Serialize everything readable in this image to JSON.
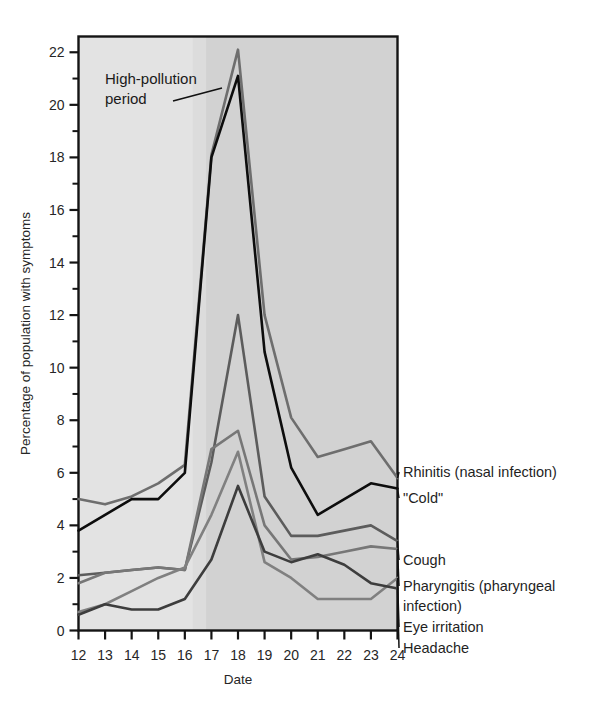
{
  "chart_data": {
    "type": "line",
    "title": "",
    "xlabel": "Date",
    "ylabel": "Percentage of population with symptoms",
    "x": [
      12,
      13,
      14,
      15,
      16,
      17,
      18,
      19,
      20,
      21,
      22,
      23,
      24
    ],
    "xlim": [
      12,
      24
    ],
    "ylim": [
      0,
      22.6
    ],
    "ytick_major": [
      0,
      2,
      4,
      6,
      8,
      10,
      12,
      14,
      16,
      18,
      20,
      22
    ],
    "ytick_minor": [
      1,
      3,
      5,
      7,
      9,
      11,
      13,
      15,
      17,
      19,
      21
    ],
    "grid": false,
    "legend_position": "right-inline-labels",
    "series": [
      {
        "name": "Rhinitis (nasal infection)",
        "label": "Rhinitis (nasal infection)",
        "color": "#6e6e6e",
        "width": 2.6,
        "values": [
          5.0,
          4.8,
          5.1,
          5.6,
          6.3,
          18.1,
          22.1,
          12.0,
          8.1,
          6.6,
          6.9,
          7.2,
          5.8
        ]
      },
      {
        "name": "\"Cold\"",
        "label": "\"Cold\"",
        "color": "#0d0d0d",
        "width": 2.6,
        "values": [
          3.8,
          4.4,
          5.0,
          5.0,
          6.0,
          18.0,
          21.1,
          10.6,
          6.2,
          4.4,
          5.0,
          5.6,
          5.4
        ]
      },
      {
        "name": "Cough",
        "label": "Cough",
        "color": "#5c5c5c",
        "width": 2.6,
        "values": [
          2.1,
          2.2,
          2.3,
          2.4,
          2.3,
          6.4,
          12.0,
          5.1,
          3.6,
          3.6,
          3.8,
          4.0,
          3.4
        ]
      },
      {
        "name": "Pharyngitis (pharyngeal infection)",
        "label": "Pharyngitis (pharyngeal infection)",
        "color": "#777777",
        "width": 2.6,
        "values": [
          1.8,
          2.2,
          2.3,
          2.4,
          2.3,
          6.9,
          7.6,
          4.0,
          2.7,
          2.8,
          3.0,
          3.2,
          3.1
        ]
      },
      {
        "name": "Eye irritation",
        "label": "Eye irritation",
        "color": "#808080",
        "width": 2.6,
        "values": [
          0.7,
          1.0,
          1.5,
          2.0,
          2.4,
          4.4,
          6.8,
          2.6,
          2.0,
          1.2,
          1.2,
          1.2,
          2.0
        ]
      },
      {
        "name": "Headache",
        "label": "Headache",
        "color": "#3d3d3d",
        "width": 2.6,
        "values": [
          0.6,
          1.0,
          0.8,
          0.8,
          1.2,
          2.7,
          5.5,
          3.0,
          2.6,
          2.9,
          2.5,
          1.8,
          1.6
        ]
      }
    ],
    "annotations": [
      {
        "name": "high-pollution-period",
        "text_line1": "High-pollution",
        "text_line2": "period"
      }
    ],
    "shading": {
      "band_start": 16.3,
      "band_end": 24,
      "band_color": "#dcdcdc",
      "inner_band_start": 16.8,
      "inner_band_color": "#d2d2d2",
      "plot_bg": "#e3e3e3"
    }
  },
  "axes": {
    "x_tick_labels": [
      "12",
      "13",
      "14",
      "15",
      "16",
      "17",
      "18",
      "19",
      "20",
      "21",
      "22",
      "23",
      "24"
    ],
    "y_tick_labels": [
      "0",
      "2",
      "4",
      "6",
      "8",
      "10",
      "12",
      "14",
      "16",
      "18",
      "20",
      "22"
    ],
    "x_title": "Date",
    "y_title": "Percentage of population with symptoms"
  },
  "legend": {
    "items": [
      "Rhinitis (nasal infection)",
      "\"Cold\"",
      "Cough",
      "Pharyngitis (pharyngeal",
      "infection)",
      "Eye irritation",
      "Headache"
    ]
  }
}
